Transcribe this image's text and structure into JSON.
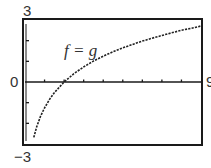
{
  "chart_data": {
    "type": "line",
    "title": "",
    "annotation": "f = g",
    "xlabel": "",
    "ylabel": "",
    "xlim": [
      0,
      9
    ],
    "ylim": [
      -3,
      3
    ],
    "x_tick_step": 1,
    "y_tick_step": 1,
    "grid": false,
    "legend": "none",
    "axis_labels": {
      "y_top": "3",
      "y_bottom": "−3",
      "y_zero": "0",
      "x_right": "9"
    },
    "series": [
      {
        "name": "f = g",
        "style": "dotted",
        "x": [
          0.45,
          0.6,
          0.8,
          1.0,
          1.25,
          1.5,
          2.0,
          2.5,
          3.0,
          3.5,
          4.0,
          4.5,
          5.0,
          5.5,
          6.0,
          6.5,
          7.0,
          7.5,
          8.0,
          8.5,
          9.0
        ],
        "y": [
          -2.68,
          -2.17,
          -1.65,
          -1.25,
          -0.85,
          -0.52,
          0.0,
          0.4,
          0.73,
          1.01,
          1.25,
          1.46,
          1.65,
          1.82,
          1.98,
          2.12,
          2.25,
          2.38,
          2.5,
          2.6,
          2.71
        ]
      }
    ]
  },
  "colors": {
    "frame": "#1a1a1a",
    "curve": "#222222",
    "text": "#333333"
  }
}
